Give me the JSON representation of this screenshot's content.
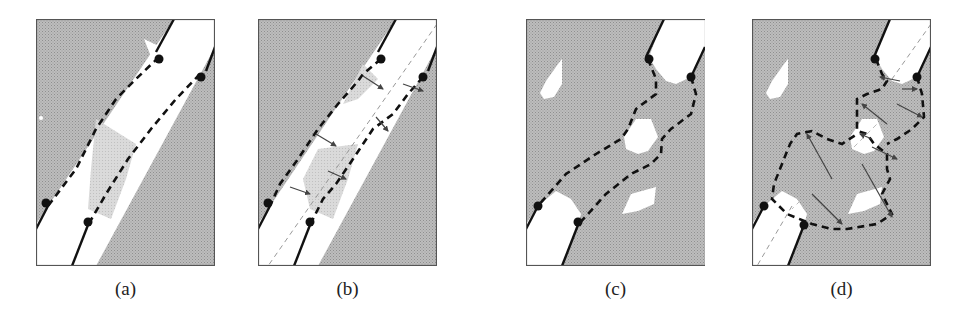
{
  "figure": {
    "panels": [
      {
        "id": "a",
        "caption": "(a)",
        "left": 36
      },
      {
        "id": "b",
        "caption": "(b)",
        "left": 258
      },
      {
        "id": "c",
        "caption": "(c)",
        "left": 526
      },
      {
        "id": "d",
        "caption": "(d)",
        "left": 752
      }
    ],
    "colors": {
      "background_region": "#b8b8b8",
      "free_region": "#ffffff",
      "light_region": "#d6d6d6",
      "frame": "#555555",
      "boundary_line": "#111111",
      "contour_dashed": "#111111",
      "centerline": "#999999",
      "arrows": "#444444"
    },
    "legend": {
      "solid_line": "fixed boundary",
      "dashed_line": "deformable contour",
      "dot": "endpoint anchor"
    }
  }
}
